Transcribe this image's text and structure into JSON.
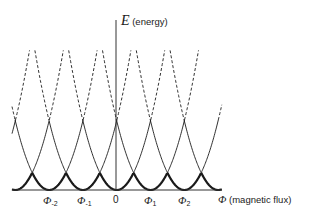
{
  "axes": {
    "y_label_symbol": "E",
    "y_label_text": "(energy)",
    "x_label_symbol": "Φ",
    "x_label_text": "(magnetic flux)"
  },
  "ticks": [
    {
      "symbol": "Φ",
      "sub": "-2",
      "x": 49
    },
    {
      "symbol": "Φ",
      "sub": "-1",
      "x": 83
    },
    {
      "symbol": "",
      "sub": "",
      "text": "0",
      "x": 116
    },
    {
      "symbol": "Φ",
      "sub": "1",
      "x": 150
    },
    {
      "symbol": "Φ",
      "sub": "2",
      "x": 184
    }
  ],
  "geometry": {
    "baseline_y": 190,
    "axis_x": 116,
    "axis_top_y": 20,
    "x_min": 12,
    "x_max": 222,
    "centers": [
      -18.5,
      15.3,
      49.1,
      82.9,
      116.7,
      150.5,
      184.3,
      218.1
    ],
    "solid_half_width": 34,
    "dashed_half_width": 48,
    "curvature": 0.0606
  },
  "colors": {
    "line": "#1a1a1a",
    "axis": "#333333"
  }
}
